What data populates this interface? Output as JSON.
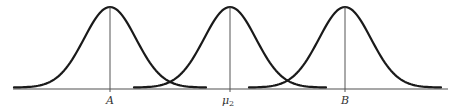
{
  "figure": {
    "colors": {
      "curve": "#1a1a1a",
      "baseline": "#8a8a8a",
      "mean_line": "#555555",
      "label": "#333333",
      "background": "#ffffff"
    },
    "baseline": {
      "x1": 13,
      "x2": 448,
      "y": 89
    },
    "peak_y": 7,
    "tail_y": 87.5,
    "sigma_px": 26,
    "half_width_px": 96,
    "curves": [
      {
        "id": "curve-a",
        "mean_x": 110,
        "label": "A"
      },
      {
        "id": "curve-mu2",
        "mean_x": 230,
        "label": "μ",
        "label_sub": "2"
      },
      {
        "id": "curve-b",
        "mean_x": 345,
        "label": "B"
      }
    ]
  },
  "labels": {
    "a": "A",
    "mu2_main": "μ",
    "mu2_sub": "2",
    "b": "B"
  }
}
